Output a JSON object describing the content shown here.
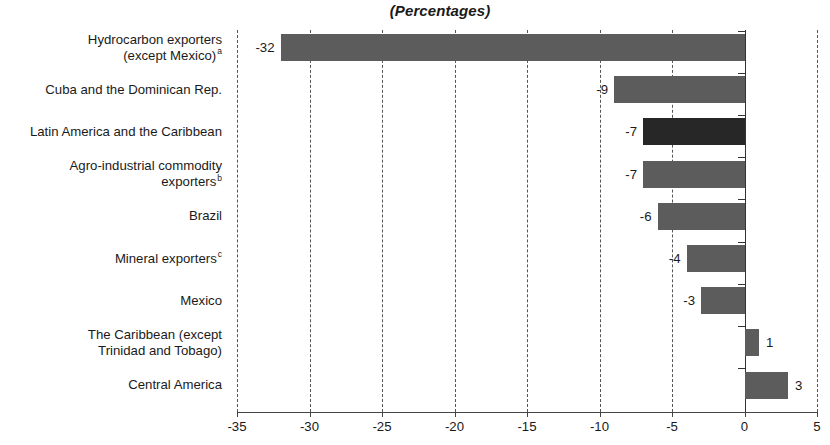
{
  "chart_data": {
    "type": "bar",
    "orientation": "horizontal",
    "title": "(Percentages)",
    "xlabel": "",
    "ylabel": "",
    "xlim": [
      -35,
      5
    ],
    "xticks": [
      -35,
      -30,
      -25,
      -20,
      -15,
      -10,
      -5,
      0,
      5
    ],
    "xtick_labels": [
      "-35",
      "-30",
      "-25",
      "-20",
      "-15",
      "-10",
      "-5",
      "0",
      "5"
    ],
    "grid": "vertical-dashed",
    "legend": "none",
    "categories": [
      "Hydrocarbon exporters\n(except Mexico)",
      "Cuba and the Dominican Rep.",
      "Latin America and the Caribbean",
      "Agro-industrial commodity\nexporters",
      "Brazil",
      "Mineral exporters",
      "Mexico",
      "The Caribbean (except\nTrinidad and Tobago)",
      "Central America"
    ],
    "category_footnotes": [
      "a",
      "",
      "",
      "b",
      "",
      "c",
      "",
      "",
      ""
    ],
    "values": [
      -32,
      -9,
      -7,
      -7,
      -6,
      -4,
      -3,
      1,
      3
    ],
    "value_labels": [
      "-32",
      "-9",
      "-7",
      "-7",
      "-6",
      "-4",
      "-3",
      "1",
      "3"
    ],
    "highlight_index": 2,
    "colors": {
      "bar": "#5c5c5c",
      "bar_highlight": "#272727",
      "gridline": "#555555",
      "axis": "#333333",
      "text": "#1a1a1a",
      "background": "#ffffff"
    }
  }
}
